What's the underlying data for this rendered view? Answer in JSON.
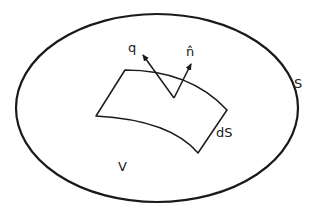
{
  "diagram": {
    "labels": {
      "flux_vector": "q",
      "normal_vector": "n̂",
      "enclosing_surface": "S",
      "surface_element": "dS",
      "volume": "V"
    },
    "colors": {
      "stroke": "#1a1a1a",
      "background": "#ffffff"
    }
  }
}
